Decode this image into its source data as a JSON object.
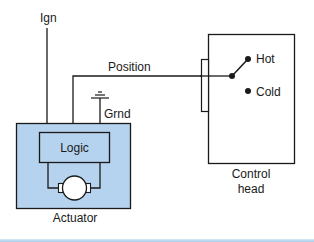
{
  "diagram": {
    "labels": {
      "ignition": "Ign",
      "position": "Position",
      "ground": "Grnd",
      "logic": "Logic",
      "actuator": "Actuator",
      "hot": "Hot",
      "cold": "Cold",
      "control_head_line1": "Control",
      "control_head_line2": "head"
    },
    "colors": {
      "actuator_fill": "#b5d3ee",
      "logic_fill": "#b5d3ee",
      "stroke": "#1a1a1a",
      "motor_fill": "#ffffff",
      "control_head_fill": "#ffffff",
      "bottom_rule": "#a9cde8"
    },
    "switch": {
      "selected_position": "Hot"
    }
  }
}
